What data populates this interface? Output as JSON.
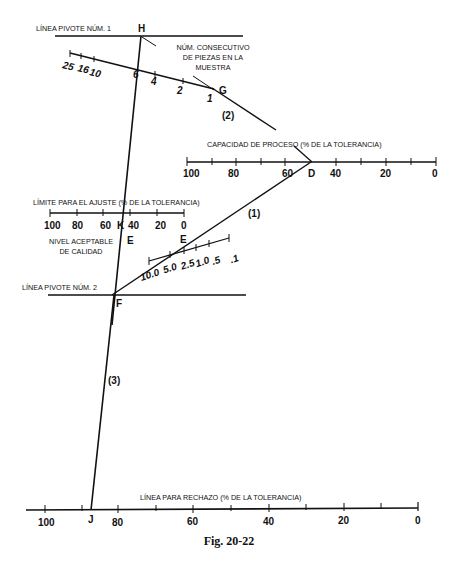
{
  "figure": {
    "caption": "Fig. 20-22",
    "pivot1": {
      "label": "LÍNEA PIVOTE NÚM. 1",
      "point": "H"
    },
    "sample_scale": {
      "label_lines": [
        "NÚM. CONSECUTIVO",
        "DE PIEZAS EN LA",
        "MUESTRA"
      ],
      "ticks": [
        "25",
        "16",
        "10",
        "6",
        "4",
        "2",
        "1"
      ],
      "point": "G"
    },
    "segment_labels": {
      "s1": "(1)",
      "s2": "(2)",
      "s3": "(3)"
    },
    "capacity_scale": {
      "label": "CAPACIDAD DE PROCESO (% DE LA TOLERANCIA)",
      "ticks": [
        "100",
        "80",
        "60",
        "40",
        "20",
        "0"
      ],
      "point": "D"
    },
    "adjust_scale": {
      "label": "LÍMITE PARA EL AJUSTE (% DE LA TOLERANCIA)",
      "ticks": [
        "100",
        "80",
        "60",
        "40",
        "20",
        "0"
      ],
      "point": "K"
    },
    "aql_scale": {
      "label_lines": [
        "NIVEL ACEPTABLE",
        "DE CALIDAD"
      ],
      "point_label": "E",
      "ticks": [
        "10.0",
        "5.0",
        "2.5",
        "1.0",
        ".5",
        ".1"
      ],
      "point": "E"
    },
    "pivot2": {
      "label": "LÍNEA PIVOTE NÚM. 2",
      "point": "F"
    },
    "reject_scale": {
      "label": "LÍNEA PARA RECHAZO (% DE LA TOLERANCIA)",
      "ticks": [
        "100",
        "80",
        "60",
        "40",
        "20",
        "0"
      ],
      "point": "J"
    }
  }
}
